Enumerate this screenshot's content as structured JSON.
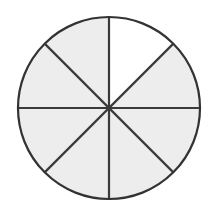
{
  "figure": {
    "type": "geometric-diagram",
    "background_color": "#ffffff",
    "canvas": {
      "width": 217,
      "height": 214
    }
  },
  "chart_data": {
    "type": "pie",
    "subtitle": "",
    "xlabel": "",
    "ylabel": "",
    "categories": [
      "Sector 1",
      "Sector 2",
      "Sector 3",
      "Sector 4",
      "Sector 5",
      "Sector 6",
      "Sector 7",
      "Sector 8"
    ],
    "values": [
      12.5,
      12.5,
      12.5,
      12.5,
      12.5,
      12.5,
      12.5,
      12.5
    ],
    "value_unit": "percent",
    "slice_angle_degrees": 45,
    "slice_fraction": "1/8",
    "total_slices": 8,
    "shaded_slices": 8,
    "unshaded_slices": 0,
    "legend": [],
    "legend_position": "none",
    "grid": false,
    "labels_shown": false,
    "colors": {
      "slice_fill": "#ededed",
      "outline": "#333333",
      "divider": "#3a3a3a",
      "background": "#ffffff"
    }
  },
  "geometry": {
    "center_x": 109,
    "center_y": 108,
    "radius": 91,
    "outline_width": 2.2,
    "divider_width": 2.2,
    "diameters": [
      {
        "name": "vertical-diameter",
        "angle_degrees": 90
      },
      {
        "name": "horizontal-diameter",
        "angle_degrees": 0
      },
      {
        "name": "diagonal-diameter-nw-se",
        "angle_degrees": 45
      },
      {
        "name": "diagonal-diameter-ne-sw",
        "angle_degrees": 135
      }
    ]
  }
}
